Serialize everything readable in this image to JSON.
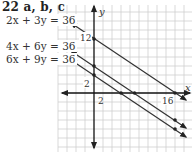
{
  "title": "22 a, b, c",
  "equations": [
    {
      "label": "2x + 3y = 36",
      "a": 2,
      "b": 3,
      "c": 36,
      "y_intercept": 12,
      "x_intercept": 18
    },
    {
      "label": "4x + 6y = 36",
      "a": 4,
      "b": 6,
      "c": 36,
      "y_intercept": 6,
      "x_intercept": 9
    },
    {
      "label": "6x + 9y = 36",
      "a": 6,
      "b": 9,
      "c": 36,
      "y_intercept": 4,
      "x_intercept": 6
    }
  ],
  "axes": {
    "x_label": "x",
    "y_label": "y",
    "tick_labels": {
      "x_2": "2",
      "x_16": "16",
      "y_2": "2",
      "y_12": "12"
    }
  },
  "grid": {
    "units_per_cell": 2
  },
  "colors": {
    "line": "#333333",
    "grid": "#c8c8c8",
    "axis": "#111111"
  }
}
